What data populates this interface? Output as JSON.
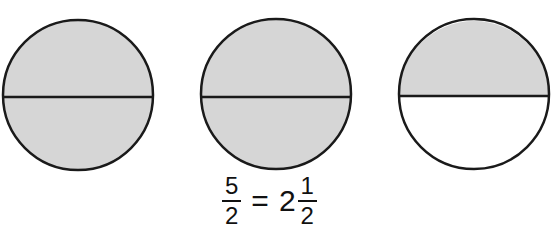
{
  "colors": {
    "shaded": "#d6d6d6",
    "unshaded": "#ffffff",
    "stroke": "#1a1a1a"
  },
  "circles": [
    {
      "label": "circle-1",
      "top_half": "shaded",
      "bottom_half": "shaded"
    },
    {
      "label": "circle-2",
      "top_half": "shaded",
      "bottom_half": "shaded"
    },
    {
      "label": "circle-3",
      "top_half": "shaded",
      "bottom_half": "unshaded"
    }
  ],
  "equation": {
    "improper_fraction": {
      "numerator": "5",
      "denominator": "2"
    },
    "equals": "=",
    "mixed_number": {
      "whole": "2",
      "numerator": "1",
      "denominator": "2"
    }
  }
}
